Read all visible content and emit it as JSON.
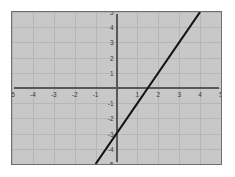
{
  "chart_data": {
    "type": "line",
    "title": "",
    "subtitle": "",
    "xlabel": "",
    "ylabel": "",
    "xlim": [
      -5,
      5
    ],
    "ylim": [
      -5,
      5
    ],
    "grid": true,
    "legend": null,
    "x_ticks": [
      -5,
      -4,
      -3,
      -2,
      -1,
      1,
      2,
      3,
      4,
      5
    ],
    "y_ticks": [
      5,
      4,
      3,
      2,
      1,
      -1,
      -2,
      -3,
      -4,
      -5
    ],
    "x_tick_labels": [
      "-5",
      "-4",
      "-3",
      "-2",
      "-1",
      "1",
      "2",
      "3",
      "4",
      "5"
    ],
    "y_tick_labels": [
      "5",
      "4",
      "3",
      "2",
      "1",
      "-1",
      "-2",
      "-3",
      "-4",
      "-5"
    ],
    "series": [
      {
        "name": "y = 2x - 3",
        "slope": 2,
        "intercept": -3,
        "x_intercept": 1.5,
        "points": [
          [
            -1,
            -5
          ],
          [
            4,
            5
          ]
        ],
        "color": "#141414"
      }
    ],
    "colors": {
      "plot_background": "#c8c8c8",
      "grid": "#b6b6b6",
      "axis": "#585858",
      "line": "#141414",
      "frame_border": "#6e6e6e",
      "page_background": "#ffffff",
      "tick_text": "#3a3a3a"
    }
  }
}
